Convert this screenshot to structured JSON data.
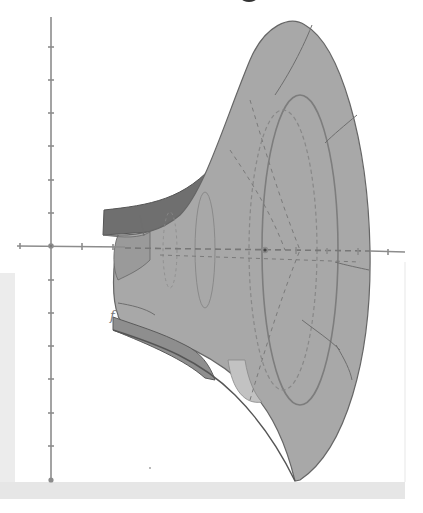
{
  "figure": {
    "function_label": "f",
    "colors": {
      "surface_front": "#a6a6a6",
      "surface_back": "#8a8a8a",
      "surface_inner": "#6f6f6f",
      "outline": "#5a5a5a",
      "axis": "#8c8c8c",
      "background": "#ffffff",
      "panel": "#ececec"
    },
    "axes": {
      "origin_px": [
        51,
        246
      ],
      "vertical": {
        "top_px": 17,
        "bottom_px": 480,
        "tick_spacing_px": 33,
        "tick_count_above": 6,
        "tick_count_below": 7
      },
      "horizontal": {
        "left_px": 17,
        "right_px": 405,
        "tick_spacing_px": 31,
        "tick_count": 12
      }
    }
  }
}
